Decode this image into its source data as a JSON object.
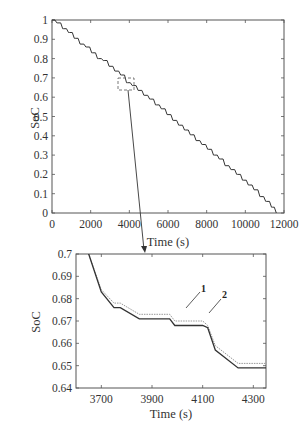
{
  "chart_data": [
    {
      "type": "line",
      "title": "",
      "xlabel": "Time (s)",
      "ylabel": "SoC",
      "xlim": [
        0,
        12000
      ],
      "ylim": [
        0,
        1
      ],
      "xticks": [
        "0",
        "2000",
        "4000",
        "6000",
        "8000",
        "10000",
        "12000"
      ],
      "yticks": [
        "0",
        "0.1",
        "0.2",
        "0.3",
        "0.4",
        "0.5",
        "0.6",
        "0.7",
        "0.8",
        "0.9",
        "1"
      ],
      "grid": false,
      "series": [
        {
          "name": "SoC",
          "x": [
            0,
            300,
            600,
            900,
            1200,
            1500,
            1800,
            2100,
            2400,
            2700,
            3000,
            3300,
            3600,
            3900,
            4200,
            4500,
            4800,
            5100,
            5400,
            5700,
            6000,
            6300,
            6600,
            6900,
            7200,
            7500,
            7800,
            8100,
            8400,
            8700,
            9000,
            9300,
            9600,
            9900,
            10200,
            10500,
            10800,
            11100,
            11400,
            11600
          ],
          "values": [
            1.0,
            0.985,
            0.955,
            0.935,
            0.905,
            0.875,
            0.86,
            0.83,
            0.8,
            0.79,
            0.76,
            0.735,
            0.715,
            0.675,
            0.66,
            0.635,
            0.61,
            0.59,
            0.56,
            0.54,
            0.51,
            0.48,
            0.455,
            0.43,
            0.405,
            0.375,
            0.355,
            0.33,
            0.3,
            0.28,
            0.245,
            0.225,
            0.2,
            0.17,
            0.145,
            0.12,
            0.085,
            0.06,
            0.03,
            0.0
          ]
        }
      ],
      "annotations": [
        "dashed zoom box around t≈3600–4350 s, SoC≈0.64–0.70 with arrow to lower plot"
      ]
    },
    {
      "type": "line",
      "title": "",
      "xlabel": "Time (s)",
      "ylabel": "SoC",
      "xlim": [
        3600,
        4350
      ],
      "ylim": [
        0.64,
        0.7
      ],
      "xticks": [
        "3700",
        "3900",
        "4100",
        "4300"
      ],
      "yticks": [
        "0.64",
        "0.65",
        "0.66",
        "0.67",
        "0.68",
        "0.69",
        "0.7"
      ],
      "grid": false,
      "series": [
        {
          "name": "1",
          "x": [
            3600,
            3650,
            3700,
            3750,
            3775,
            3850,
            3970,
            3990,
            4100,
            4120,
            4150,
            4240,
            4350
          ],
          "values": [
            0.71,
            0.7,
            0.684,
            0.678,
            0.678,
            0.673,
            0.673,
            0.67,
            0.67,
            0.668,
            0.659,
            0.651,
            0.651
          ]
        },
        {
          "name": "2",
          "x": [
            3600,
            3650,
            3700,
            3750,
            3775,
            3850,
            3970,
            3990,
            4100,
            4120,
            4150,
            4240,
            4350
          ],
          "values": [
            0.71,
            0.7,
            0.683,
            0.676,
            0.676,
            0.671,
            0.671,
            0.668,
            0.668,
            0.667,
            0.657,
            0.649,
            0.649
          ]
        }
      ],
      "annotations": [
        "1",
        "2"
      ]
    }
  ],
  "top": {
    "ylabel": "SoC",
    "xlabel": "Time (s)",
    "xticks": [
      "0",
      "2000",
      "4000",
      "6000",
      "8000",
      "10000",
      "12000"
    ],
    "yticks": [
      "0",
      "0.1",
      "0.2",
      "0.3",
      "0.4",
      "0.5",
      "0.6",
      "0.7",
      "0.8",
      "0.9",
      "1"
    ]
  },
  "bottom": {
    "ylabel": "SoC",
    "xlabel": "Time (s)",
    "xticks": [
      "3700",
      "3900",
      "4100",
      "4300"
    ],
    "yticks": [
      "0.64",
      "0.65",
      "0.66",
      "0.67",
      "0.68",
      "0.69",
      "0.7"
    ],
    "label1": "1",
    "label2": "2"
  },
  "colors": {
    "axis": "#444444",
    "curve": "#333333",
    "curve_light": "#999999"
  }
}
